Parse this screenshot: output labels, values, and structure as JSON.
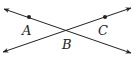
{
  "diagram": {
    "type": "intersecting-lines",
    "lines": [
      {
        "name": "line-AB",
        "from": [
          4,
          9
        ],
        "to": [
          131,
          53
        ],
        "arrows": "both"
      },
      {
        "name": "line-CB",
        "from": [
          3,
          52
        ],
        "to": [
          131,
          8
        ],
        "arrows": "both"
      }
    ],
    "points": [
      {
        "label": "A",
        "x": 29,
        "y": 17,
        "label_x": 22,
        "label_y": 24
      },
      {
        "label": "B",
        "x": 67,
        "y": 31,
        "label_x": 62,
        "label_y": 38
      },
      {
        "label": "C",
        "x": 105,
        "y": 17,
        "label_x": 98,
        "label_y": 24
      }
    ],
    "stroke_color": "#222222"
  }
}
